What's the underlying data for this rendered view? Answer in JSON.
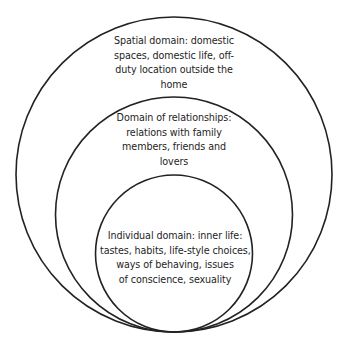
{
  "diagram": {
    "type": "nested-circles",
    "stroke_color": "#222222",
    "background_color": "#ffffff",
    "circles": [
      {
        "name": "spatial-domain",
        "lines": [
          "Spatial domain: domestic",
          "spaces, domestic life, off-",
          "duty location outside the",
          "home"
        ]
      },
      {
        "name": "domain-of-relationships",
        "lines": [
          "Domain of relationships:",
          "relations with family",
          "members, friends and",
          "lovers"
        ]
      },
      {
        "name": "individual-domain",
        "lines": [
          "Individual domain: inner life:",
          "tastes, habits, life-style choices,",
          "ways of behaving, issues",
          "of conscience, sexuality"
        ]
      }
    ]
  }
}
